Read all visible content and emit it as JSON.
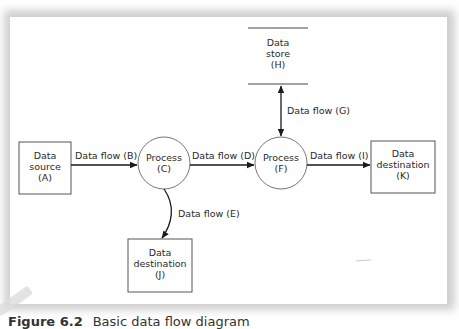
{
  "diagram": {
    "type": "data flow diagram",
    "nodes": [
      {
        "id": "A",
        "kind": "external-entity",
        "lines": [
          "Data",
          "source",
          "(A)"
        ]
      },
      {
        "id": "C",
        "kind": "process",
        "lines": [
          "Process",
          "(C)"
        ]
      },
      {
        "id": "F",
        "kind": "process",
        "lines": [
          "Process",
          "(F)"
        ]
      },
      {
        "id": "H",
        "kind": "data-store",
        "lines": [
          "Data",
          "store",
          "(H)"
        ]
      },
      {
        "id": "J",
        "kind": "external-entity",
        "lines": [
          "Data",
          "destination",
          "(J)"
        ]
      },
      {
        "id": "K",
        "kind": "external-entity",
        "lines": [
          "Data",
          "destination",
          "(K)"
        ]
      }
    ],
    "edges": [
      {
        "from": "A",
        "to": "C",
        "label": "Data flow (B)"
      },
      {
        "from": "C",
        "to": "F",
        "label": "Data flow (D)"
      },
      {
        "from": "C",
        "to": "J",
        "label": "Data flow (E)"
      },
      {
        "from": "F",
        "to": "H",
        "label": "Data flow (G)",
        "bidirectional": true
      },
      {
        "from": "F",
        "to": "K",
        "label": "Data flow (I)"
      }
    ]
  },
  "caption": {
    "number": "Figure 6.2",
    "text": "Basic data flow diagram"
  }
}
